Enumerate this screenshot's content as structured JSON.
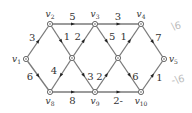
{
  "diagram": {
    "type": "weighted-directed-graph",
    "nodes": [
      {
        "id": "v1",
        "label": "v",
        "sub": "1",
        "x": 26,
        "y": 59
      },
      {
        "id": "v2",
        "label": "v",
        "sub": "2",
        "x": 50,
        "y": 24
      },
      {
        "id": "v3",
        "label": "v",
        "sub": "3",
        "x": 95,
        "y": 24
      },
      {
        "id": "v4",
        "label": "v",
        "sub": "4",
        "x": 141,
        "y": 24
      },
      {
        "id": "v5",
        "label": "v",
        "sub": "5",
        "x": 164,
        "y": 59
      },
      {
        "id": "v8",
        "label": "v",
        "sub": "8",
        "x": 50,
        "y": 92
      },
      {
        "id": "v9",
        "label": "v",
        "sub": "9",
        "x": 95,
        "y": 92
      },
      {
        "id": "v10",
        "label": "v",
        "sub": "10",
        "x": 141,
        "y": 92
      },
      {
        "id": "cL",
        "label": "",
        "sub": "",
        "x": 72,
        "y": 58
      },
      {
        "id": "cR",
        "label": "",
        "sub": "",
        "x": 118,
        "y": 58
      }
    ],
    "edges": [
      {
        "from": "v1",
        "to": "v2",
        "weight": "3"
      },
      {
        "from": "v1",
        "to": "v8",
        "weight": "6"
      },
      {
        "from": "v2",
        "to": "v3",
        "weight": "5"
      },
      {
        "from": "v3",
        "to": "v4",
        "weight": "3"
      },
      {
        "from": "v4",
        "to": "v5",
        "weight": "7"
      },
      {
        "from": "v10",
        "to": "v5",
        "weight": "1"
      },
      {
        "from": "v8",
        "to": "v9",
        "weight": "8"
      },
      {
        "from": "v9",
        "to": "v10",
        "weight": "2-"
      },
      {
        "from": "v2",
        "to": "cL",
        "weight": "1"
      },
      {
        "from": "cL",
        "to": "v3",
        "weight": "2"
      },
      {
        "from": "cL",
        "to": "v8",
        "weight": "4"
      },
      {
        "from": "cL",
        "to": "v9",
        "weight": "3"
      },
      {
        "from": "v3",
        "to": "cR",
        "weight": "5"
      },
      {
        "from": "cR",
        "to": "v4",
        "weight": "1"
      },
      {
        "from": "v9",
        "to": "cR",
        "weight": "2"
      },
      {
        "from": "cR",
        "to": "v10",
        "weight": "6"
      }
    ],
    "annotations": [
      {
        "text": "\\6",
        "x": 172,
        "y": 30
      },
      {
        "text": "-\\6",
        "x": 172,
        "y": 84
      }
    ]
  }
}
